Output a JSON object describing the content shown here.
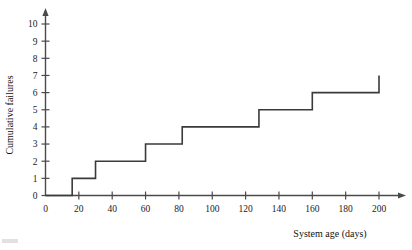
{
  "chart_data": {
    "type": "line",
    "subtype": "step",
    "title": "",
    "xlabel": "System age (days)",
    "ylabel": "Cumulative failures",
    "xlim": [
      0,
      205
    ],
    "ylim": [
      0,
      10
    ],
    "xticks": [
      0,
      20,
      40,
      60,
      80,
      100,
      120,
      140,
      160,
      180,
      200
    ],
    "xticklabels": [
      "0",
      "20",
      "40",
      "60",
      "80",
      "100",
      "120",
      "140",
      "160",
      "180",
      "200"
    ],
    "yticks": [
      0,
      1,
      2,
      3,
      4,
      5,
      6,
      7,
      8,
      9,
      10
    ],
    "yticklabels": [
      "0",
      "1",
      "2",
      "3",
      "4",
      "5",
      "6",
      "7",
      "8",
      "9",
      "10"
    ],
    "grid": false,
    "legend": false,
    "axis_arrows": true,
    "series": [
      {
        "name": "Cumulative failures",
        "color": "#3a3a3a",
        "step_mode": "post",
        "failure_times": [
          16,
          30,
          60,
          82,
          128,
          160,
          200
        ],
        "x": [
          0,
          16,
          16,
          30,
          30,
          60,
          60,
          82,
          82,
          128,
          128,
          160,
          160,
          200,
          200
        ],
        "y": [
          0,
          0,
          1,
          1,
          2,
          2,
          3,
          3,
          4,
          4,
          5,
          5,
          6,
          6,
          7
        ]
      }
    ]
  },
  "axes": {
    "x_title": "System age (days)",
    "y_title": "Cumulative failures"
  }
}
